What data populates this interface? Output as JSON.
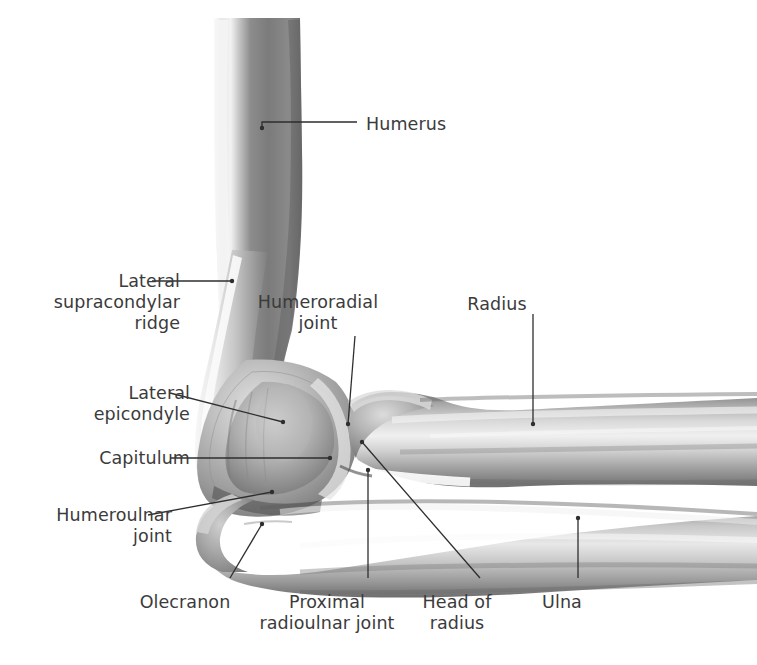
{
  "figure": {
    "background": "#ffffff",
    "ink_color": "#3b3b3b",
    "leader_color": "#2e2e2e",
    "bone_palette": {
      "shadow": "#6f6f6f",
      "mid": "#9a9a9a",
      "light": "#c9c9c9",
      "highlight": "#ececec",
      "deep": "#555555"
    }
  },
  "labels": [
    {
      "id": "humerus",
      "text": "Humerus",
      "align": "left",
      "x": 366,
      "y": 114
    },
    {
      "id": "lateral-supracondylar-ridge",
      "text": "Lateral\nsupracondylar\nridge",
      "align": "right",
      "x": 30,
      "y": 271
    },
    {
      "id": "humeroradial-joint",
      "text": "Humeroradial\njoint",
      "align": "center",
      "x": 318,
      "y": 292
    },
    {
      "id": "radius",
      "text": "Radius",
      "align": "center",
      "x": 497,
      "y": 294
    },
    {
      "id": "lateral-epicondyle",
      "text": "Lateral\nepicondyle",
      "align": "right",
      "x": 40,
      "y": 383
    },
    {
      "id": "capitulum",
      "text": "Capitulum",
      "align": "right",
      "x": 40,
      "y": 448
    },
    {
      "id": "humeroulnar-joint",
      "text": "Humeroulnar\njoint",
      "align": "right",
      "x": 22,
      "y": 505
    },
    {
      "id": "olecranon",
      "text": "Olecranon",
      "align": "center",
      "x": 185,
      "y": 592
    },
    {
      "id": "proximal-radioulnar-joint",
      "text": "Proximal\nradioulnar joint",
      "align": "center",
      "x": 327,
      "y": 592
    },
    {
      "id": "head-of-radius",
      "text": "Head of\nradius",
      "align": "center",
      "x": 457,
      "y": 592
    },
    {
      "id": "ulna",
      "text": "Ulna",
      "align": "center",
      "x": 562,
      "y": 592
    }
  ],
  "leaders": [
    {
      "id": "leader-humerus",
      "points": "357,122 262,122 262,128",
      "dot": "262,128"
    },
    {
      "id": "leader-lateral-supracondylar-ridge",
      "points": "152,281 232,281",
      "dot": "232,281"
    },
    {
      "id": "leader-humeroradial-joint",
      "points": "355,336 348,424",
      "dot": "348,424"
    },
    {
      "id": "leader-radius",
      "points": "533,314 533,424",
      "dot": "533,424"
    },
    {
      "id": "leader-lateral-epicondyle",
      "points": "170,393 283,422",
      "dot": "283,422"
    },
    {
      "id": "leader-capitulum",
      "points": "170,458 330,458",
      "dot": "330,458"
    },
    {
      "id": "leader-humeroulnar-joint",
      "points": "148,515 272,492",
      "dot": "272,492"
    },
    {
      "id": "leader-olecranon",
      "points": "230,578 262,524",
      "dot": "262,524"
    },
    {
      "id": "leader-proximal-radioulnar-joint",
      "points": "368,578 368,470",
      "dot": "368,470"
    },
    {
      "id": "leader-head-of-radius",
      "points": "480,578 362,442",
      "dot": "362,442"
    },
    {
      "id": "leader-ulna",
      "points": "578,578 578,518",
      "dot": "578,518"
    }
  ],
  "structures": [
    {
      "id": "humerus-shaft",
      "name": "Humerus shaft"
    },
    {
      "id": "distal-humerus",
      "name": "Distal humerus with trochlea and capitulum"
    },
    {
      "id": "radius-bone",
      "name": "Radius"
    },
    {
      "id": "ulna-bone",
      "name": "Ulna with olecranon"
    }
  ]
}
